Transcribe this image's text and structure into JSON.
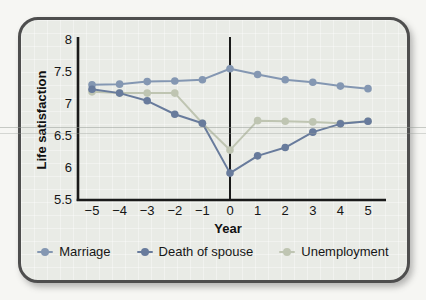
{
  "chart": {
    "ylabel": "Life satisfaction",
    "xlabel": "Year"
  },
  "chart_data": {
    "type": "line",
    "x": [
      -5,
      -4,
      -3,
      -2,
      -1,
      0,
      1,
      2,
      3,
      4,
      5
    ],
    "x_tick_labels": [
      "−5",
      "−4",
      "−3",
      "−2",
      "−1",
      "0",
      "1",
      "2",
      "3",
      "4",
      "5"
    ],
    "y_tick_labels": [
      "8",
      "7.5",
      "7",
      "6.5",
      "6",
      "5.5"
    ],
    "series": [
      {
        "name": "Marriage",
        "color": "#8497b2",
        "values": [
          7.3,
          7.31,
          7.35,
          7.36,
          7.38,
          7.55,
          7.46,
          7.38,
          7.34,
          7.28,
          7.24
        ]
      },
      {
        "name": "Death of spouse",
        "color": "#687b9c",
        "values": [
          7.23,
          7.17,
          7.05,
          6.84,
          6.7,
          5.92,
          6.19,
          6.32,
          6.56,
          6.69,
          6.73
        ]
      },
      {
        "name": "Unemployment",
        "color": "#bfc5b2",
        "values": [
          7.19,
          7.17,
          7.17,
          7.17,
          6.7,
          6.28,
          6.74,
          6.73,
          6.72,
          6.7,
          6.73
        ]
      }
    ],
    "title": "",
    "xlabel": "Year",
    "ylabel": "Life satisfaction",
    "xlim": [
      -5.5,
      5.5
    ],
    "ylim": [
      5.5,
      8
    ],
    "y_tick_step": 0.5,
    "grid": false,
    "zero_line_at_x": 0,
    "legend_position": "bottom",
    "axis_color": "#1a1a1a"
  }
}
